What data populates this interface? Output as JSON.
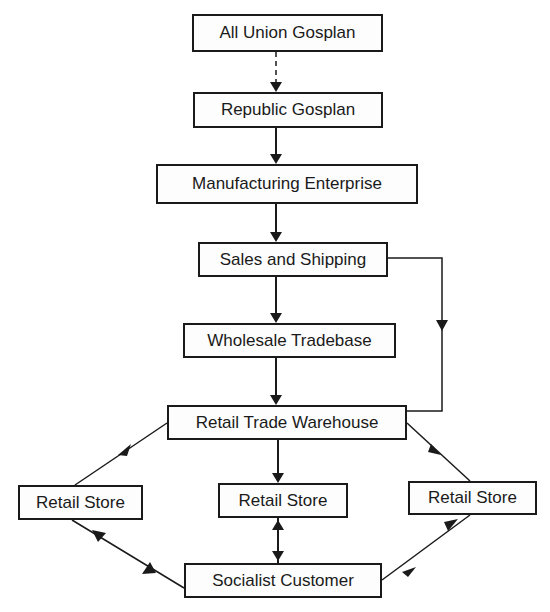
{
  "diagram": {
    "nodes": {
      "all_union_gosplan": "All Union Gosplan",
      "republic_gosplan": "Republic Gosplan",
      "manufacturing_enterprise": "Manufacturing Enterprise",
      "sales_and_shipping": "Sales and Shipping",
      "wholesale_tradebase": "Wholesale Tradebase",
      "retail_trade_warehouse": "Retail Trade Warehouse",
      "retail_store_left": "Retail Store",
      "retail_store_center": "Retail Store",
      "retail_store_right": "Retail Store",
      "socialist_customer": "Socialist Customer"
    },
    "edges": [
      {
        "from": "All Union Gosplan",
        "to": "Republic Gosplan",
        "style": "dashed"
      },
      {
        "from": "Republic Gosplan",
        "to": "Manufacturing Enterprise",
        "style": "solid"
      },
      {
        "from": "Manufacturing Enterprise",
        "to": "Sales and Shipping",
        "style": "solid"
      },
      {
        "from": "Sales and Shipping",
        "to": "Wholesale Tradebase",
        "style": "solid"
      },
      {
        "from": "Sales and Shipping",
        "to": "Retail Trade Warehouse",
        "style": "solid",
        "route": "right-bypass"
      },
      {
        "from": "Wholesale Tradebase",
        "to": "Retail Trade Warehouse",
        "style": "solid"
      },
      {
        "from": "Retail Trade Warehouse",
        "to": "Retail Store (left)",
        "style": "solid"
      },
      {
        "from": "Retail Trade Warehouse",
        "to": "Retail Store (center)",
        "style": "solid"
      },
      {
        "from": "Retail Trade Warehouse",
        "to": "Retail Store (right)",
        "style": "solid"
      },
      {
        "from": "Retail Store (left)",
        "to": "Socialist Customer",
        "style": "solid",
        "bidirectional": true
      },
      {
        "from": "Retail Store (center)",
        "to": "Socialist Customer",
        "style": "solid",
        "bidirectional": true
      },
      {
        "from": "Retail Store (right)",
        "to": "Socialist Customer",
        "style": "solid",
        "bidirectional": true
      }
    ]
  }
}
